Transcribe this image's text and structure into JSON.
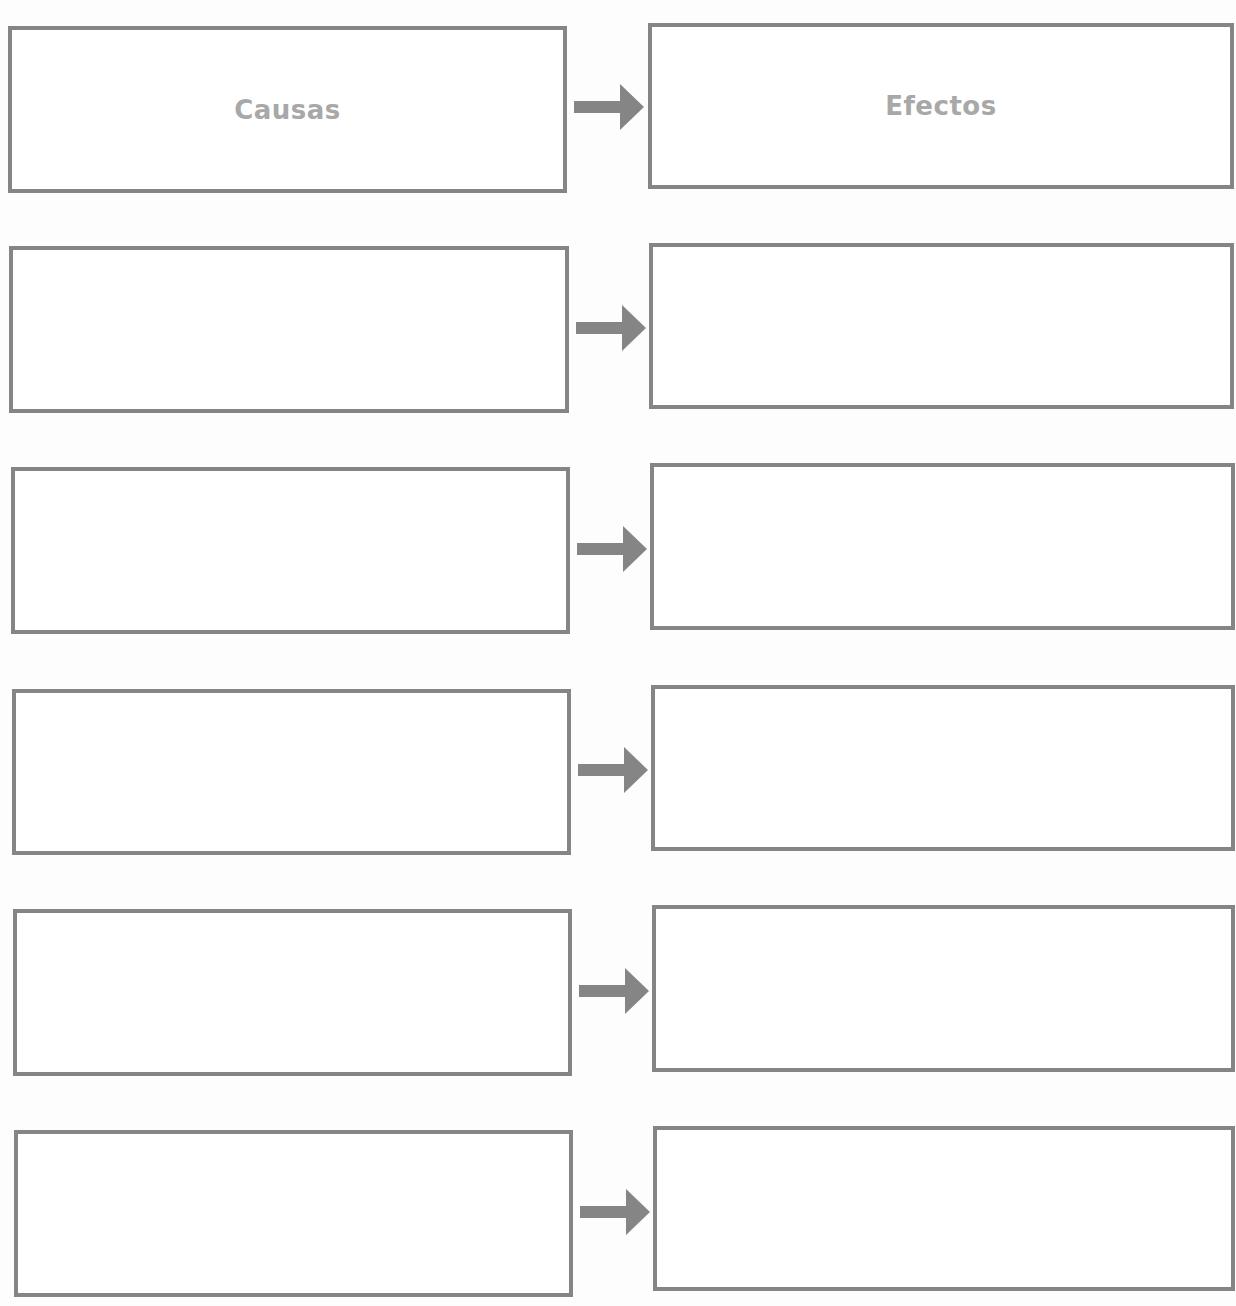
{
  "diagram": {
    "type": "cause-effect-organizer",
    "headers": {
      "cause": "Causas",
      "effect": "Efectos"
    },
    "colors": {
      "border": "#858585",
      "arrow": "#858585",
      "header_text": "#a8a8a8"
    },
    "rows": [
      {
        "cause": "Causas",
        "effect": "Efectos"
      },
      {
        "cause": "",
        "effect": ""
      },
      {
        "cause": "",
        "effect": ""
      },
      {
        "cause": "",
        "effect": ""
      },
      {
        "cause": "",
        "effect": ""
      },
      {
        "cause": "",
        "effect": ""
      }
    ]
  }
}
